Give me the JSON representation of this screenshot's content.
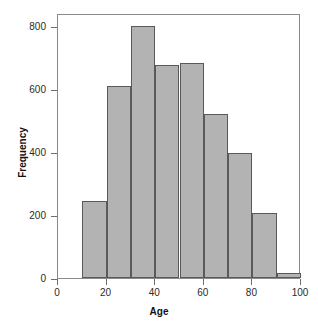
{
  "chart_data": {
    "type": "bar",
    "title": "",
    "subtitle": "",
    "xlabel": "Age",
    "ylabel": "Frequency",
    "categories": [
      "10-20",
      "20-30",
      "30-40",
      "40-50",
      "50-60",
      "60-70",
      "70-80",
      "80-90",
      "90-100"
    ],
    "bin_edges": [
      10,
      20,
      30,
      40,
      50,
      60,
      70,
      80,
      90,
      100
    ],
    "values": [
      245,
      610,
      800,
      675,
      680,
      520,
      395,
      205,
      15
    ],
    "xlim": [
      0,
      100
    ],
    "ylim": [
      0,
      840
    ],
    "xticks": [
      0,
      20,
      40,
      60,
      80,
      100
    ],
    "yticks": [
      0,
      200,
      400,
      600,
      800
    ],
    "xtick_labels": [
      "0",
      "20",
      "40",
      "60",
      "80",
      "100"
    ],
    "ytick_labels": [
      "0",
      "200",
      "400",
      "600",
      "800"
    ],
    "grid": false,
    "legend": false,
    "legend_position": "none",
    "bar_fill_color": "#b3b3b3",
    "bar_edge_color": "#595959",
    "frame_color": "#8a8a8a",
    "background_color": "#ffffff",
    "text_color": "#2b2b2b"
  }
}
